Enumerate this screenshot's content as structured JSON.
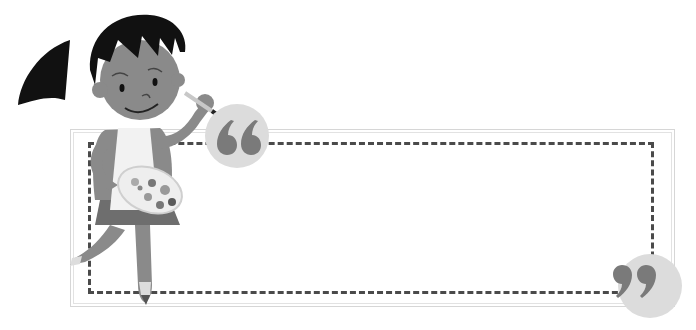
{
  "illustration": {
    "subject": "girl painting with brush and palette",
    "colors": {
      "hair": "#111111",
      "skin": "#8a8a8a",
      "apron": "#f2f2f2",
      "skirt": "#6e6e6e",
      "palette": "#eeeeee",
      "paint_spots": [
        "#777777",
        "#999999",
        "#5a5a5a",
        "#aaaaaa"
      ]
    }
  },
  "frame": {
    "outer_border_color": "#d6d6d6",
    "dashed_border_color": "#4a4a4a",
    "message": ""
  },
  "quotes": {
    "open_icon": "open-quote-icon",
    "close_icon": "close-quote-icon",
    "badge_color": "#dcdcdc",
    "mark_color": "#7a7a7a"
  }
}
